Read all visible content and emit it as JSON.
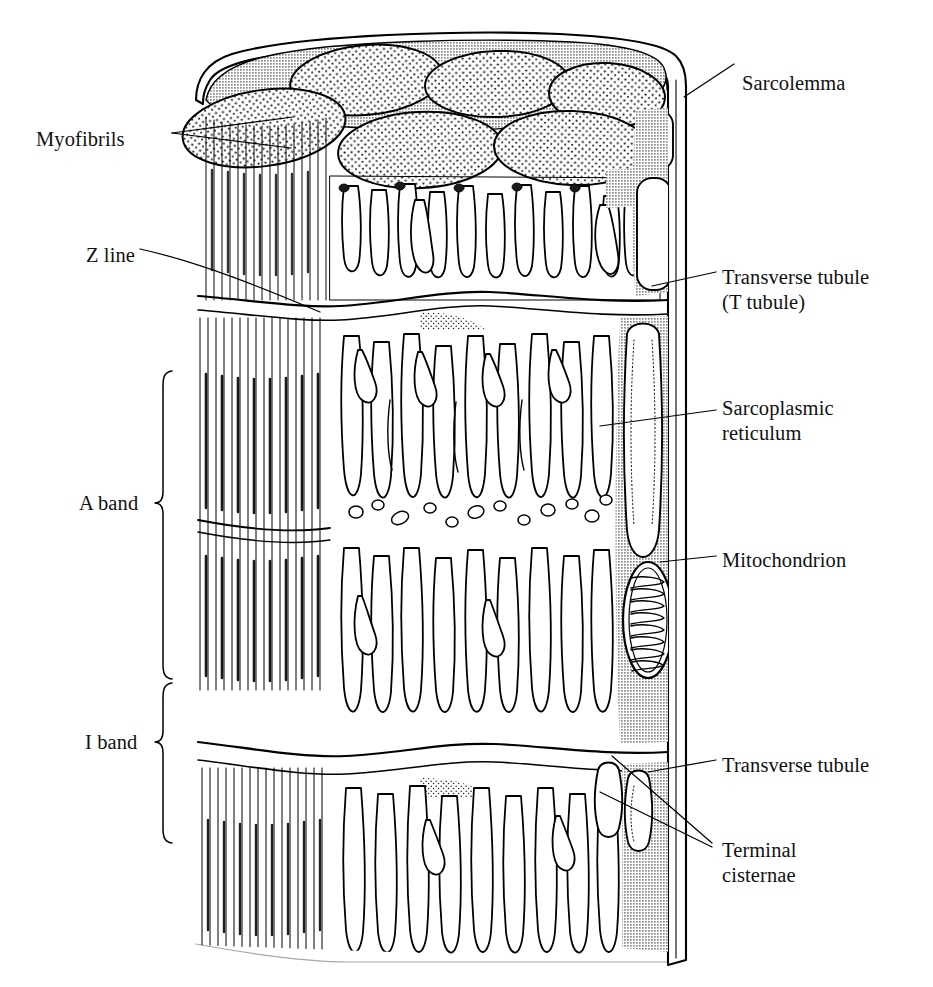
{
  "figure": {
    "width": 933,
    "height": 987,
    "background": "#ffffff",
    "ink": "#000000",
    "sarcoplasm_gray": "#b3b3b3",
    "stipple_gray": "#4a4a4a"
  },
  "labels": {
    "myofibrils": "Myofibrils",
    "z_line": "Z line",
    "a_band": "A band",
    "i_band": "I band",
    "sarcolemma": "Sarcolemma",
    "transverse_tubule_t": "Transverse tubule",
    "transverse_tubule_t2": "(T tubule)",
    "sarcoplasmic_reticulum_1": "Sarcoplasmic",
    "sarcoplasmic_reticulum_2": "reticulum",
    "mitochondrion": "Mitochondrion",
    "transverse_tubule_2": "Transverse tubule",
    "terminal_cisternae_1": "Terminal",
    "terminal_cisternae_2": "cisternae"
  },
  "label_positions": {
    "myofibrils": {
      "x": 36,
      "y": 127,
      "align": "left"
    },
    "z_line": {
      "x": 86,
      "y": 243,
      "align": "left"
    },
    "a_band": {
      "x": 79,
      "y": 503,
      "align": "left"
    },
    "i_band": {
      "x": 85,
      "y": 742,
      "align": "left"
    },
    "sarcolemma": {
      "x": 742,
      "y": 71,
      "align": "left"
    },
    "transverse_tubule": {
      "x": 722,
      "y": 265,
      "align": "left"
    },
    "sarcoplasmic": {
      "x": 722,
      "y": 396,
      "align": "left"
    },
    "mitochondrion": {
      "x": 722,
      "y": 548,
      "align": "left"
    },
    "transverse_tubule2": {
      "x": 722,
      "y": 753,
      "align": "left"
    },
    "terminal_cisternae": {
      "x": 722,
      "y": 838,
      "align": "left"
    }
  },
  "leader_lines": [
    {
      "name": "myofibrils-leader-a",
      "x1": 172,
      "y1": 133,
      "x2": 293,
      "y2": 118
    },
    {
      "name": "myofibrils-leader-b",
      "x1": 172,
      "y1": 133,
      "x2": 291,
      "y2": 147
    },
    {
      "name": "z-line-leader",
      "x1": 140,
      "y1": 249,
      "x2": 318,
      "y2": 311
    },
    {
      "name": "sarcolemma-leader",
      "x1": 732,
      "y1": 66,
      "x2": 684,
      "y2": 96
    },
    {
      "name": "t-tubule-leader",
      "x1": 716,
      "y1": 272,
      "x2": 654,
      "y2": 284
    },
    {
      "name": "sr-leader",
      "x1": 716,
      "y1": 410,
      "x2": 604,
      "y2": 425
    },
    {
      "name": "mito-leader",
      "x1": 716,
      "y1": 555,
      "x2": 664,
      "y2": 560
    },
    {
      "name": "t-tubule2-leader",
      "x1": 716,
      "y1": 760,
      "x2": 651,
      "y2": 770
    },
    {
      "name": "tc-leader-a",
      "x1": 712,
      "y1": 845,
      "x2": 612,
      "y2": 757
    },
    {
      "name": "tc-leader-b",
      "x1": 712,
      "y1": 845,
      "x2": 604,
      "y2": 793
    }
  ],
  "brackets": {
    "a_band": {
      "top": 371,
      "bottom": 679,
      "x": 162
    },
    "i_band": {
      "top": 683,
      "bottom": 843,
      "x": 162
    }
  },
  "structures": {
    "myofibril_cross_sections": 6,
    "longitudinal_sr_tubules_upper": 14,
    "longitudinal_sr_tubules_middle": 18,
    "longitudinal_sr_tubules_lower": 14,
    "mitochondrion_cristae": 14,
    "z_lines": 4,
    "sarcomere_bands": [
      "A band",
      "I band"
    ]
  }
}
